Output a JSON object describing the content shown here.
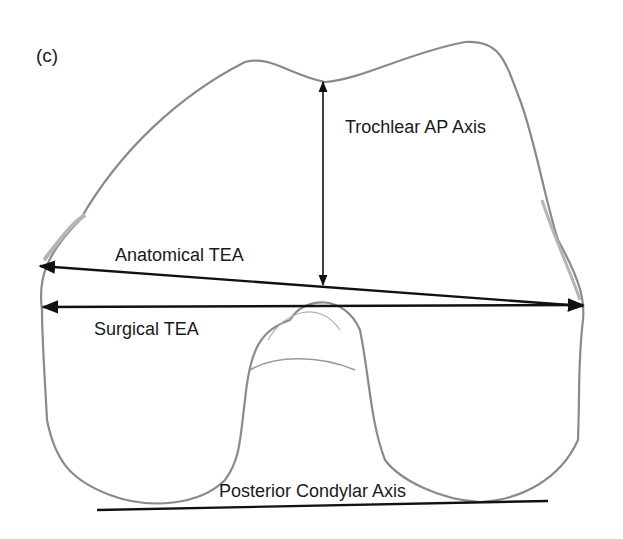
{
  "panel_label": "(c)",
  "labels": {
    "trochlear": "Trochlear AP Axis",
    "anatomical": "Anatomical TEA",
    "surgical": "Surgical TEA",
    "posterior": "Posterior Condylar Axis"
  },
  "colors": {
    "bone_outline": "#8a8a8a",
    "axis_line": "#111111",
    "text": "#1a1a1a"
  }
}
